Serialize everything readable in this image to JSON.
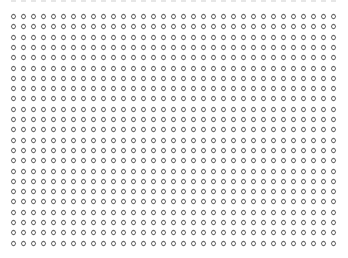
{
  "pattern": {
    "description": "regular grid of small diamond-outline markers on white background",
    "marker_shape": "diamond-outline",
    "marker_color": "#6a6a6a",
    "background_color": "#ffffff",
    "columns": 33,
    "rows": 23,
    "origin_x": 11,
    "origin_y": 14,
    "pitch_x": 10,
    "pitch_y": 10.3,
    "marker_size": 5
  },
  "top_strip": {
    "description": "clipped remnants of a row cut off at top edge",
    "color": "#e6e6e6"
  }
}
